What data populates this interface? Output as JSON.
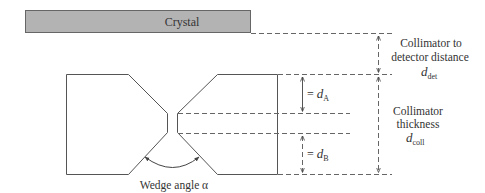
{
  "diagram": {
    "crystal": {
      "label": "Crystal",
      "fill": "#b3b3b3",
      "stroke": "#666666"
    },
    "collimator": {
      "stroke": "#555555"
    },
    "labels": {
      "det_line1": "Collimator to",
      "det_line2": "detector distance",
      "det_symbol": "d",
      "det_sub": "det",
      "coll_line1": "Collimator",
      "coll_line2": "thickness",
      "coll_symbol": "d",
      "coll_sub": "coll",
      "dA_prefix": "= ",
      "dA_symbol": "d",
      "dA_sub": "A",
      "dB_prefix": "= ",
      "dB_symbol": "d",
      "dB_sub": "B",
      "wedge": "Wedge angle α"
    }
  }
}
